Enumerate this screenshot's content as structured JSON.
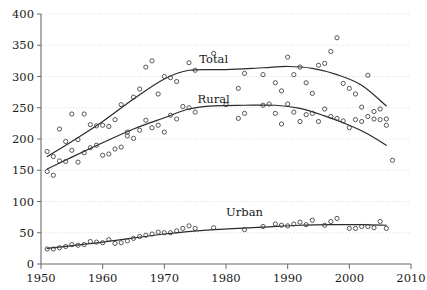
{
  "chart_data": {
    "type": "scatter",
    "title": "",
    "subtitle": "",
    "xlabel": "",
    "ylabel": "",
    "xlim": [
      1950,
      2010
    ],
    "ylim": [
      0,
      400
    ],
    "xticks": [
      1950,
      1960,
      1970,
      1980,
      1990,
      2000,
      2010
    ],
    "xtick_labels": [
      "1950",
      "1960",
      "1970",
      "1980",
      "1990",
      "2000",
      "2010"
    ],
    "yticks": [
      0,
      50,
      100,
      150,
      200,
      250,
      300,
      350,
      400
    ],
    "ytick_labels": [
      "0",
      "50",
      "100",
      "150",
      "200",
      "250",
      "300",
      "350",
      "400"
    ],
    "grid": "horizontal-dotted",
    "legend_position": "inline-annotations",
    "marker_style": "open-circle",
    "series": [
      {
        "name": "Total",
        "label": "Total",
        "label_x": 1978,
        "label_y": 322,
        "color": "#2b2b2b",
        "points": [
          {
            "x": 1951,
            "y": 180
          },
          {
            "x": 1952,
            "y": 172
          },
          {
            "x": 1953,
            "y": 216
          },
          {
            "x": 1954,
            "y": 196
          },
          {
            "x": 1955,
            "y": 240
          },
          {
            "x": 1956,
            "y": 199
          },
          {
            "x": 1957,
            "y": 240
          },
          {
            "x": 1958,
            "y": 223
          },
          {
            "x": 1959,
            "y": 221
          },
          {
            "x": 1960,
            "y": 222
          },
          {
            "x": 1961,
            "y": 220
          },
          {
            "x": 1962,
            "y": 231
          },
          {
            "x": 1963,
            "y": 255
          },
          {
            "x": 1964,
            "y": 211
          },
          {
            "x": 1965,
            "y": 267
          },
          {
            "x": 1966,
            "y": 280
          },
          {
            "x": 1967,
            "y": 315
          },
          {
            "x": 1968,
            "y": 325
          },
          {
            "x": 1969,
            "y": 272
          },
          {
            "x": 1970,
            "y": 300
          },
          {
            "x": 1971,
            "y": 298
          },
          {
            "x": 1972,
            "y": 292
          },
          {
            "x": 1974,
            "y": 322
          },
          {
            "x": 1975,
            "y": 310
          },
          {
            "x": 1978,
            "y": 337
          },
          {
            "x": 1982,
            "y": 281
          },
          {
            "x": 1983,
            "y": 305
          },
          {
            "x": 1986,
            "y": 303
          },
          {
            "x": 1988,
            "y": 290
          },
          {
            "x": 1989,
            "y": 277
          },
          {
            "x": 1990,
            "y": 331
          },
          {
            "x": 1991,
            "y": 303
          },
          {
            "x": 1992,
            "y": 315
          },
          {
            "x": 1993,
            "y": 290
          },
          {
            "x": 1994,
            "y": 273
          },
          {
            "x": 1995,
            "y": 318
          },
          {
            "x": 1996,
            "y": 321
          },
          {
            "x": 1997,
            "y": 340
          },
          {
            "x": 1998,
            "y": 362
          },
          {
            "x": 1999,
            "y": 289
          },
          {
            "x": 2000,
            "y": 281
          },
          {
            "x": 2001,
            "y": 272
          },
          {
            "x": 2002,
            "y": 251
          },
          {
            "x": 2003,
            "y": 302
          },
          {
            "x": 2004,
            "y": 244
          },
          {
            "x": 2005,
            "y": 248
          },
          {
            "x": 2006,
            "y": 232
          }
        ],
        "trend": [
          {
            "x": 1951,
            "y": 172
          },
          {
            "x": 1955,
            "y": 196
          },
          {
            "x": 1960,
            "y": 228
          },
          {
            "x": 1965,
            "y": 264
          },
          {
            "x": 1970,
            "y": 296
          },
          {
            "x": 1974,
            "y": 310
          },
          {
            "x": 1980,
            "y": 311
          },
          {
            "x": 1986,
            "y": 314
          },
          {
            "x": 1990,
            "y": 316
          },
          {
            "x": 1994,
            "y": 313
          },
          {
            "x": 1998,
            "y": 303
          },
          {
            "x": 2002,
            "y": 286
          },
          {
            "x": 2006,
            "y": 253
          }
        ]
      },
      {
        "name": "Rural",
        "label": "Rural",
        "label_x": 1978,
        "label_y": 258,
        "color": "#2b2b2b",
        "points": [
          {
            "x": 1951,
            "y": 148
          },
          {
            "x": 1952,
            "y": 142
          },
          {
            "x": 1953,
            "y": 165
          },
          {
            "x": 1954,
            "y": 164
          },
          {
            "x": 1955,
            "y": 182
          },
          {
            "x": 1956,
            "y": 163
          },
          {
            "x": 1957,
            "y": 178
          },
          {
            "x": 1958,
            "y": 186
          },
          {
            "x": 1959,
            "y": 190
          },
          {
            "x": 1960,
            "y": 174
          },
          {
            "x": 1961,
            "y": 176
          },
          {
            "x": 1962,
            "y": 184
          },
          {
            "x": 1963,
            "y": 187
          },
          {
            "x": 1964,
            "y": 205
          },
          {
            "x": 1965,
            "y": 201
          },
          {
            "x": 1966,
            "y": 214
          },
          {
            "x": 1967,
            "y": 230
          },
          {
            "x": 1968,
            "y": 218
          },
          {
            "x": 1969,
            "y": 222
          },
          {
            "x": 1970,
            "y": 211
          },
          {
            "x": 1971,
            "y": 238
          },
          {
            "x": 1972,
            "y": 232
          },
          {
            "x": 1973,
            "y": 252
          },
          {
            "x": 1974,
            "y": 250
          },
          {
            "x": 1975,
            "y": 243
          },
          {
            "x": 1980,
            "y": 255
          },
          {
            "x": 1982,
            "y": 233
          },
          {
            "x": 1983,
            "y": 241
          },
          {
            "x": 1986,
            "y": 254
          },
          {
            "x": 1987,
            "y": 256
          },
          {
            "x": 1988,
            "y": 241
          },
          {
            "x": 1989,
            "y": 224
          },
          {
            "x": 1990,
            "y": 256
          },
          {
            "x": 1991,
            "y": 243
          },
          {
            "x": 1992,
            "y": 228
          },
          {
            "x": 1993,
            "y": 239
          },
          {
            "x": 1994,
            "y": 241
          },
          {
            "x": 1995,
            "y": 228
          },
          {
            "x": 1996,
            "y": 248
          },
          {
            "x": 1997,
            "y": 236
          },
          {
            "x": 1998,
            "y": 233
          },
          {
            "x": 1999,
            "y": 229
          },
          {
            "x": 2000,
            "y": 218
          },
          {
            "x": 2001,
            "y": 231
          },
          {
            "x": 2002,
            "y": 228
          },
          {
            "x": 2003,
            "y": 236
          },
          {
            "x": 2004,
            "y": 232
          },
          {
            "x": 2005,
            "y": 231
          },
          {
            "x": 2006,
            "y": 222
          },
          {
            "x": 2007,
            "y": 166
          }
        ],
        "trend": [
          {
            "x": 1951,
            "y": 152
          },
          {
            "x": 1955,
            "y": 171
          },
          {
            "x": 1960,
            "y": 194
          },
          {
            "x": 1965,
            "y": 216
          },
          {
            "x": 1970,
            "y": 234
          },
          {
            "x": 1974,
            "y": 248
          },
          {
            "x": 1978,
            "y": 253
          },
          {
            "x": 1983,
            "y": 254
          },
          {
            "x": 1988,
            "y": 254
          },
          {
            "x": 1992,
            "y": 249
          },
          {
            "x": 1996,
            "y": 237
          },
          {
            "x": 2000,
            "y": 222
          },
          {
            "x": 2003,
            "y": 208
          },
          {
            "x": 2006,
            "y": 190
          }
        ]
      },
      {
        "name": "Urban",
        "label": "Urban",
        "label_x": 1983,
        "label_y": 77,
        "color": "#2b2b2b",
        "points": [
          {
            "x": 1951,
            "y": 24
          },
          {
            "x": 1952,
            "y": 24
          },
          {
            "x": 1953,
            "y": 26
          },
          {
            "x": 1954,
            "y": 28
          },
          {
            "x": 1955,
            "y": 31
          },
          {
            "x": 1956,
            "y": 30
          },
          {
            "x": 1957,
            "y": 31
          },
          {
            "x": 1958,
            "y": 36
          },
          {
            "x": 1959,
            "y": 35
          },
          {
            "x": 1960,
            "y": 34
          },
          {
            "x": 1961,
            "y": 39
          },
          {
            "x": 1962,
            "y": 33
          },
          {
            "x": 1963,
            "y": 34
          },
          {
            "x": 1964,
            "y": 37
          },
          {
            "x": 1965,
            "y": 41
          },
          {
            "x": 1966,
            "y": 44
          },
          {
            "x": 1967,
            "y": 46
          },
          {
            "x": 1968,
            "y": 48
          },
          {
            "x": 1969,
            "y": 51
          },
          {
            "x": 1970,
            "y": 50
          },
          {
            "x": 1971,
            "y": 50
          },
          {
            "x": 1972,
            "y": 53
          },
          {
            "x": 1973,
            "y": 57
          },
          {
            "x": 1974,
            "y": 61
          },
          {
            "x": 1975,
            "y": 57
          },
          {
            "x": 1978,
            "y": 58
          },
          {
            "x": 1983,
            "y": 55
          },
          {
            "x": 1986,
            "y": 60
          },
          {
            "x": 1988,
            "y": 64
          },
          {
            "x": 1989,
            "y": 62
          },
          {
            "x": 1990,
            "y": 61
          },
          {
            "x": 1991,
            "y": 64
          },
          {
            "x": 1992,
            "y": 67
          },
          {
            "x": 1993,
            "y": 63
          },
          {
            "x": 1994,
            "y": 70
          },
          {
            "x": 1996,
            "y": 62
          },
          {
            "x": 1997,
            "y": 68
          },
          {
            "x": 1998,
            "y": 73
          },
          {
            "x": 2000,
            "y": 57
          },
          {
            "x": 2001,
            "y": 57
          },
          {
            "x": 2002,
            "y": 60
          },
          {
            "x": 2003,
            "y": 60
          },
          {
            "x": 2004,
            "y": 58
          },
          {
            "x": 2005,
            "y": 68
          },
          {
            "x": 2006,
            "y": 57
          }
        ],
        "trend": [
          {
            "x": 1951,
            "y": 25
          },
          {
            "x": 1960,
            "y": 35
          },
          {
            "x": 1970,
            "y": 48
          },
          {
            "x": 1978,
            "y": 55
          },
          {
            "x": 1986,
            "y": 59
          },
          {
            "x": 1992,
            "y": 62
          },
          {
            "x": 1998,
            "y": 63
          },
          {
            "x": 2002,
            "y": 63
          },
          {
            "x": 2006,
            "y": 62
          }
        ]
      }
    ]
  },
  "axes": {
    "plot_left": 41,
    "plot_right": 411,
    "plot_top": 14,
    "plot_bottom": 264
  },
  "colors": {
    "line": "#2b2b2b",
    "marker": "#3a3a3a",
    "grid": "#c9c9c9",
    "axis": "#6a6a6a",
    "background": "#ffffff"
  }
}
